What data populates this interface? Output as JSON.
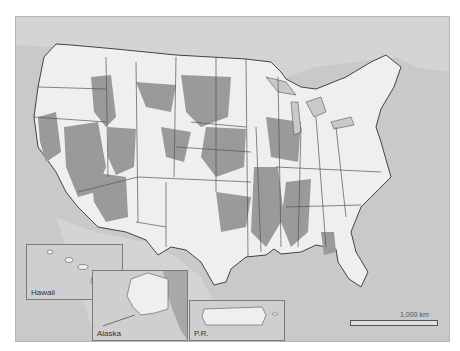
{
  "map": {
    "title": "",
    "legend": [],
    "colors": {
      "ocean": "#c9c9c9",
      "land_foreign": "#d4d4d4",
      "county_unshaded": "#efefef",
      "county_shaded": "#9a9a9a",
      "boundary": "#444444"
    },
    "insets": [
      {
        "name": "hawaii",
        "label": "Hawaii"
      },
      {
        "name": "alaska",
        "label": "Alaska"
      },
      {
        "name": "puerto-rico",
        "label": "P.R."
      }
    ],
    "scale_bar": {
      "label": "1,000 km"
    }
  }
}
